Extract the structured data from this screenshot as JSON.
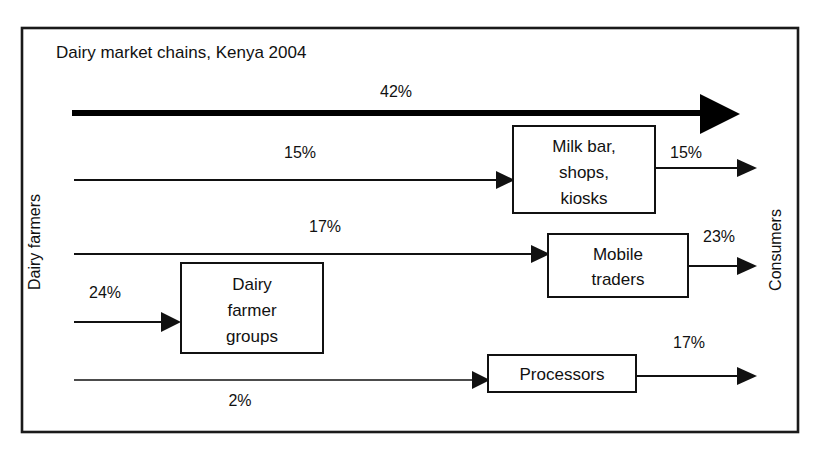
{
  "diagram": {
    "title": "Dairy market chains, Kenya 2004",
    "source_label": "Dairy farmers",
    "sink_label": "Consumers",
    "nodes": [
      {
        "id": "milk-bar",
        "lines": [
          "Milk bar,",
          "shops,",
          "kiosks"
        ]
      },
      {
        "id": "mobile-traders",
        "lines": [
          "Mobile",
          "traders"
        ]
      },
      {
        "id": "farmer-groups",
        "lines": [
          "Dairy",
          "farmer",
          "groups"
        ]
      },
      {
        "id": "processors",
        "lines": [
          "Processors"
        ]
      }
    ],
    "flows": [
      {
        "id": "direct-to-consumers",
        "from": "Dairy farmers",
        "to": "Consumers",
        "value": "42%"
      },
      {
        "id": "farmers-to-milkbar",
        "from": "Dairy farmers",
        "to": "Milk bar, shops, kiosks",
        "value": "15%"
      },
      {
        "id": "milkbar-to-consumers",
        "from": "Milk bar, shops, kiosks",
        "to": "Consumers",
        "value": "15%"
      },
      {
        "id": "farmers-to-mobiletraders",
        "from": "Dairy farmers",
        "to": "Mobile traders",
        "value": "17%"
      },
      {
        "id": "mobiletraders-to-consumers",
        "from": "Mobile traders",
        "to": "Consumers",
        "value": "23%"
      },
      {
        "id": "farmers-to-farmergroups",
        "from": "Dairy farmers",
        "to": "Dairy farmer groups",
        "value": "24%"
      },
      {
        "id": "farmers-to-processors",
        "from": "Dairy farmers",
        "to": "Processors",
        "value": "2%"
      },
      {
        "id": "processors-to-consumers",
        "from": "Processors",
        "to": "Consumers",
        "value": "17%"
      }
    ],
    "colors": {
      "line": "#111111",
      "box_fill": "#ffffff",
      "border": "#1a1a1a",
      "background": "#ffffff"
    }
  }
}
